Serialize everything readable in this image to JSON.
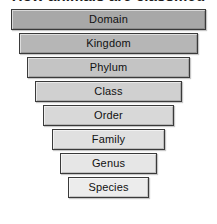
{
  "diagram": {
    "title": "How animals are classified",
    "title_cropped": true,
    "background_color": "#ffffff",
    "border_color": "#3a3a3a",
    "text_color": "#111111",
    "shape": "inverted-pyramid",
    "canvas": {
      "width": 217,
      "height": 224
    },
    "ranks": [
      {
        "label": "Domain",
        "level": 1,
        "fill": "#a8a8a8",
        "x": 11,
        "y": 9,
        "width": 195,
        "height": 21
      },
      {
        "label": "Kingdom",
        "level": 2,
        "fill": "#b6b6b6",
        "x": 19,
        "y": 33,
        "width": 179,
        "height": 21
      },
      {
        "label": "Phylum",
        "level": 3,
        "fill": "#c4c4c4",
        "x": 27,
        "y": 57,
        "width": 163,
        "height": 21
      },
      {
        "label": "Class",
        "level": 4,
        "fill": "#d0d0d0",
        "x": 35,
        "y": 81,
        "width": 147,
        "height": 21
      },
      {
        "label": "Order",
        "level": 5,
        "fill": "#d8d8d8",
        "x": 43,
        "y": 105,
        "width": 131,
        "height": 21
      },
      {
        "label": "Family",
        "level": 6,
        "fill": "#e0e0e0",
        "x": 52,
        "y": 129,
        "width": 113,
        "height": 21
      },
      {
        "label": "Genus",
        "level": 7,
        "fill": "#e6e6e6",
        "x": 60,
        "y": 153,
        "width": 97,
        "height": 21
      },
      {
        "label": "Species",
        "level": 8,
        "fill": "#ececec",
        "x": 68,
        "y": 177,
        "width": 81,
        "height": 21
      }
    ]
  }
}
